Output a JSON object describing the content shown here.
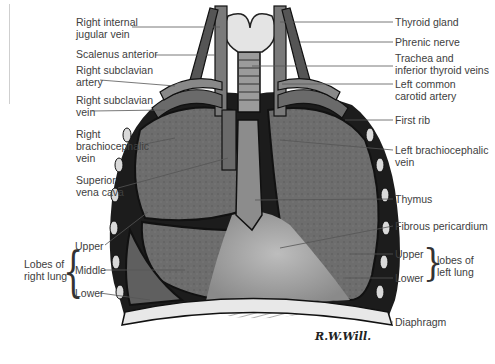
{
  "figure": {
    "signature": "R.W.Will."
  },
  "labels_left": [
    {
      "line1": "Right internal",
      "line2": "jugular vein"
    },
    {
      "line1": "Scalenus anterior",
      "line2": ""
    },
    {
      "line1": "Right subclavian",
      "line2": "artery"
    },
    {
      "line1": "Right subclavian",
      "line2": "vein"
    },
    {
      "line1": "Right",
      "line2": "brachiocephalic",
      "line3": "vein"
    },
    {
      "line1": "Superior",
      "line2": "vena cava"
    }
  ],
  "right_lung_group": {
    "group_label_line1": "Lobes of",
    "group_label_line2": "right lung",
    "lobes": [
      "Upper",
      "Middle",
      "Lower"
    ]
  },
  "labels_right": [
    {
      "line1": "Thyroid gland",
      "line2": ""
    },
    {
      "line1": "Phrenic nerve",
      "line2": ""
    },
    {
      "line1": "Trachea and",
      "line2": "inferior thyroid veins"
    },
    {
      "line1": "Left common",
      "line2": "carotid artery"
    },
    {
      "line1": "First rib",
      "line2": ""
    },
    {
      "line1": "Left brachiocephalic",
      "line2": "vein"
    },
    {
      "line1": "Thymus",
      "line2": ""
    },
    {
      "line1": "Fibrous pericardium",
      "line2": ""
    },
    {
      "line1": "Diaphragm",
      "line2": ""
    }
  ],
  "left_lung_group": {
    "lobes": [
      "Upper",
      "Lower"
    ],
    "group_label_line1": "lobes of",
    "group_label_line2": "left lung"
  }
}
